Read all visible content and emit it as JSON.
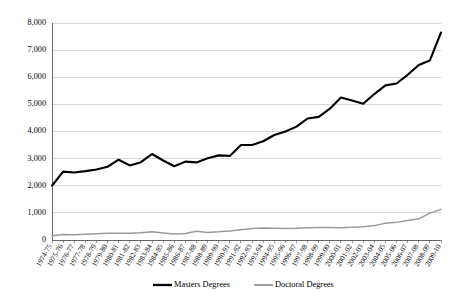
{
  "chart_data": {
    "type": "line",
    "title": "",
    "subtitle": "",
    "xlabel": "",
    "ylabel": "",
    "ylim": [
      0,
      8000
    ],
    "ytick_labels": [
      "8,000",
      "7,000",
      "6,000",
      "5,000",
      "4,000",
      "3,000",
      "2,000",
      "1,000",
      "0"
    ],
    "ytick_values": [
      8000,
      7000,
      6000,
      5000,
      4000,
      3000,
      2000,
      1000,
      0
    ],
    "grid": true,
    "legend_position": "bottom",
    "categories": [
      "1974-75",
      "1975-76",
      "1976-77",
      "1977-78",
      "1978-79",
      "1979-80",
      "1980-81",
      "1981-82",
      "1982-83",
      "1983-84",
      "1984-85",
      "1985-86",
      "1986-87",
      "1987-88",
      "1988-89",
      "1989-90",
      "1990-91",
      "1991-92",
      "1992-93",
      "1993-94",
      "1994-95",
      "1995-96",
      "1996-97",
      "1997-98",
      "1998-99",
      "1999-00",
      "2000-01",
      "2001-02",
      "2002-03",
      "2003-04",
      "2004-05",
      "2005-06",
      "2006-07",
      "2007-08",
      "2008-09",
      "2009-10"
    ],
    "series": [
      {
        "name": "Masters Degrees",
        "color": "#000000",
        "values": [
          2000,
          2520,
          2490,
          2540,
          2600,
          2700,
          2960,
          2750,
          2870,
          3170,
          2930,
          2720,
          2890,
          2860,
          3010,
          3120,
          3100,
          3500,
          3500,
          3640,
          3870,
          4000,
          4180,
          4480,
          4540,
          4840,
          5250,
          5140,
          5020,
          5380,
          5700,
          5770,
          6090,
          6450,
          6620,
          7650
        ]
      },
      {
        "name": "Doctoral Degrees",
        "color": "#9a9a9a",
        "values": [
          160,
          200,
          190,
          210,
          230,
          250,
          250,
          250,
          270,
          300,
          260,
          220,
          240,
          320,
          280,
          300,
          330,
          380,
          420,
          440,
          430,
          420,
          430,
          450,
          460,
          460,
          450,
          470,
          490,
          530,
          620,
          650,
          720,
          780,
          990,
          1130
        ]
      }
    ],
    "legend": [
      {
        "label": "Masters Degrees",
        "color": "#000000"
      },
      {
        "label": "Doctoral Degrees",
        "color": "#9a9a9a"
      }
    ]
  }
}
